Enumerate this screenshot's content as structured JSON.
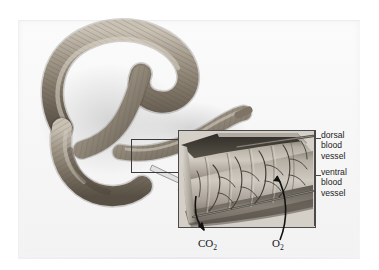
{
  "figure": {
    "style": "grayscale textbook illustration with magnified inset"
  },
  "palette": {
    "background": "#ffffff",
    "plate": "#f7f7f7",
    "worm_body": "#8d8478",
    "worm_shadow": "#5b554c",
    "worm_highlight": "#cfc7ba",
    "inset_frame": "#4a4a4a",
    "inset_tissue": "#b9b4ac",
    "capillary": "#4b4741",
    "label_text": "#1d1d1d",
    "callout_arrow_fill": "#dcdcdc",
    "callout_arrow_stroke": "#8f8f8f",
    "gas_arrow": "#111111"
  },
  "main_illustration": {
    "name": "earthworm-whole-body",
    "description": "Whole segmented earthworm curved into a loop, anterior at upper left, posterior tapering to the right",
    "selection_box": {
      "name": "magnification-selection-box",
      "x": 131,
      "y": 139,
      "width": 59,
      "height": 32
    },
    "callout_arrow": {
      "name": "callout-arrow",
      "description": "hollow gray arrow pointing from the selection box to the magnified inset"
    }
  },
  "inset": {
    "name": "body-wall-cutaway-inset",
    "description": "Magnified cutaway of the earthworm body wall showing segments and the capillary network beneath the cuticle",
    "frame": {
      "x": 178,
      "y": 130,
      "width": 136,
      "height": 96
    },
    "features": [
      "segmented cuticle surface",
      "branching capillary network",
      "cut edge revealing body wall thickness",
      "dorsal blood vessel running along the top",
      "ventral blood vessel running along the lower edge"
    ]
  },
  "labels": [
    {
      "id": "dorsal-blood-vessel",
      "text": "dorsal\nblood\nvessel",
      "lines": [
        "dorsal",
        "blood",
        "vessel"
      ],
      "leader": "short horizontal dash from inset right edge"
    },
    {
      "id": "ventral-blood-vessel",
      "text": "ventral\nblood\nvessel",
      "lines": [
        "ventral",
        "blood",
        "vessel"
      ],
      "leader": "short horizontal dash from inset right edge"
    }
  ],
  "gas_exchange": [
    {
      "id": "carbon-dioxide",
      "formula": "CO",
      "subscript": "2",
      "direction": "outward",
      "description": "curved arrow leaving the body wall, carbon dioxide diffusing out"
    },
    {
      "id": "oxygen",
      "formula": "O",
      "subscript": "2",
      "direction": "inward",
      "description": "curved arrow entering the body wall, oxygen diffusing in"
    }
  ]
}
